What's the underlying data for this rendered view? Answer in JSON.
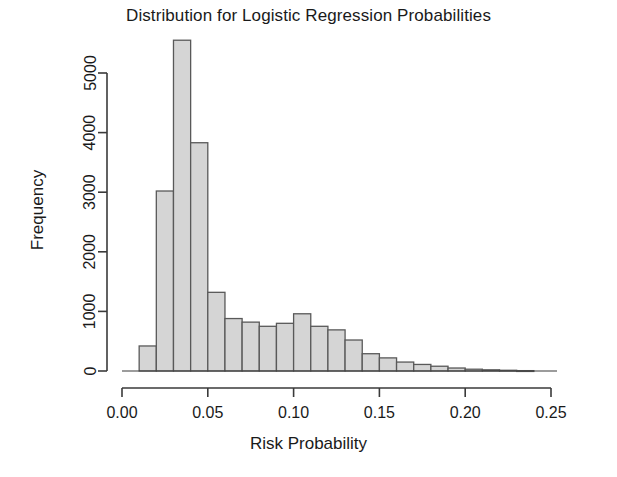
{
  "chart_data": {
    "type": "bar",
    "title": "Distribution for Logistic Regression Probabilities",
    "xlabel": "Risk Probability",
    "ylabel": "Frequency",
    "bin_width": 0.01,
    "xlim": [
      0.0,
      0.26
    ],
    "ylim": [
      0,
      5600
    ],
    "grid": false,
    "legend": null,
    "xticks": [
      "0.00",
      "0.05",
      "0.10",
      "0.15",
      "0.20",
      "0.25"
    ],
    "xtick_values": [
      0.0,
      0.05,
      0.1,
      0.15,
      0.2,
      0.25
    ],
    "yticks": [
      "0",
      "1000",
      "2000",
      "3000",
      "4000",
      "5000"
    ],
    "ytick_values": [
      0,
      1000,
      2000,
      3000,
      4000,
      5000
    ],
    "bin_starts": [
      0.01,
      0.02,
      0.03,
      0.04,
      0.05,
      0.06,
      0.07,
      0.08,
      0.09,
      0.1,
      0.11,
      0.12,
      0.13,
      0.14,
      0.15,
      0.16,
      0.17,
      0.18,
      0.19,
      0.2,
      0.21,
      0.22,
      0.23
    ],
    "categories": [
      "0.01",
      "0.02",
      "0.03",
      "0.04",
      "0.05",
      "0.06",
      "0.07",
      "0.08",
      "0.09",
      "0.10",
      "0.11",
      "0.12",
      "0.13",
      "0.14",
      "0.15",
      "0.16",
      "0.17",
      "0.18",
      "0.19",
      "0.20",
      "0.21",
      "0.22",
      "0.23"
    ],
    "values": [
      420,
      3020,
      5550,
      3830,
      1320,
      880,
      820,
      750,
      800,
      960,
      750,
      690,
      520,
      290,
      220,
      150,
      110,
      80,
      50,
      30,
      20,
      12,
      6
    ],
    "bar_fill": "#d5d5d5",
    "bar_stroke": "#595959",
    "axis_color": "#3a3a3a"
  }
}
